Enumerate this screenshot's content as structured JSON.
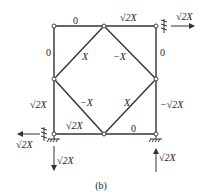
{
  "figure": {
    "caption": "(b)",
    "members": {
      "top_left": "0",
      "top_right": "√2X",
      "left_upper": "0",
      "right_upper": "0",
      "left_lower": "√2X",
      "right_lower": "−√2X",
      "bottom_left": "√2X",
      "bottom_right": "0",
      "diag_top_left": "X",
      "diag_top_right": "−X",
      "diag_bottom_left": "−X",
      "diag_bottom_right": "X"
    },
    "loads": {
      "top_right_horizontal": "√2X",
      "bottom_left_horizontal": "√2X",
      "bottom_left_vertical": "√2X",
      "bottom_right_vertical": "√2X"
    },
    "colors": {
      "line": "#333333",
      "node_fill": "#ffffff"
    }
  }
}
